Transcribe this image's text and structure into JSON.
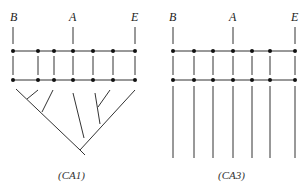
{
  "diagrams": [
    {
      "id": "CA1",
      "caption": "(CA1)",
      "labels": [
        {
          "text": "B",
          "x": 15
        },
        {
          "text": "A",
          "x": 73
        },
        {
          "text": "E",
          "x": 135
        }
      ],
      "node_x": [
        13,
        38,
        54,
        73,
        93,
        113,
        135
      ],
      "rows_y": [
        51,
        80
      ],
      "bottom": "tree"
    },
    {
      "id": "CA3",
      "caption": "(CA3)",
      "labels": [
        {
          "text": "B",
          "x": 173
        },
        {
          "text": "A",
          "x": 233
        },
        {
          "text": "E",
          "x": 295
        }
      ],
      "node_x": [
        173,
        194,
        213,
        233,
        252,
        270,
        295
      ],
      "rows_y": [
        51,
        80
      ],
      "bottom": "parallel-lines"
    }
  ]
}
